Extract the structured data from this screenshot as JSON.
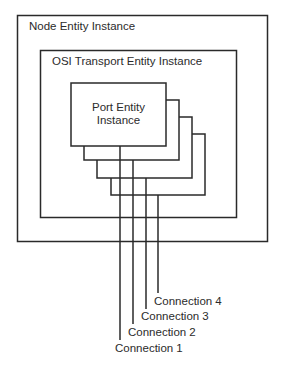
{
  "diagram": {
    "node_box": {
      "label": "Node Entity Instance"
    },
    "osi_box": {
      "label": "OSI Transport Entity Instance"
    },
    "port_box": {
      "label_line1": "Port Entity",
      "label_line2": "Instance",
      "stacked_copies": 4
    },
    "connections": [
      {
        "label": "Connection 1"
      },
      {
        "label": "Connection 2"
      },
      {
        "label": "Connection 3"
      },
      {
        "label": "Connection 4"
      }
    ],
    "line_color": "#2a2a2a"
  }
}
